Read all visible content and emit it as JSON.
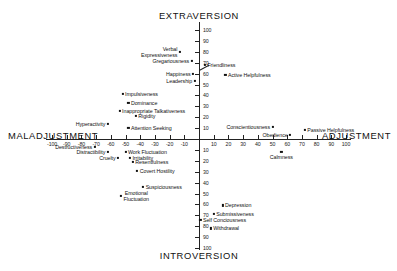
{
  "axes": {
    "top_title": "EXTRAVERSION",
    "bottom_title": "INTROVERSION",
    "left_title": "MALADJUSTMENT",
    "right_title": "ADJUSTMENT"
  },
  "chart_data": {
    "type": "scatter",
    "title": "",
    "xlabel": "MALADJUSTMENT — ADJUSTMENT",
    "ylabel": "INTROVERSION — EXTRAVERSION",
    "xlim": [
      -100,
      100
    ],
    "ylim": [
      -100,
      100
    ],
    "grid": false,
    "legend": "none",
    "xticks": [
      -100,
      -90,
      -80,
      -70,
      -60,
      -50,
      -40,
      -30,
      -20,
      -10,
      10,
      20,
      30,
      40,
      50,
      60,
      70,
      80,
      90,
      100
    ],
    "xtick_labels": [
      "-100",
      "-90",
      "-80",
      "-70",
      "-60",
      "-50",
      "-40",
      "-30",
      "-20",
      "-10",
      "10",
      "20",
      "30",
      "40",
      "50",
      "60",
      "70",
      "80",
      "90",
      "100"
    ],
    "yticks": [
      100,
      90,
      80,
      70,
      60,
      50,
      40,
      30,
      20,
      10,
      -10,
      -20,
      -30,
      -40,
      -50,
      -60,
      -70,
      -80,
      -90,
      -100
    ],
    "ytick_labels": [
      "100",
      "90",
      "80",
      "70",
      "60",
      "50",
      "40",
      "30",
      "20",
      "10",
      "10",
      "20",
      "30",
      "40",
      "50",
      "60",
      "70",
      "80",
      "90",
      "100"
    ],
    "points": [
      {
        "label": "Verbal Expressiveness",
        "x": -13,
        "y": 80,
        "anchor": "right",
        "multiline": true
      },
      {
        "label": "Gregariousness",
        "x": -5,
        "y": 72,
        "anchor": "right"
      },
      {
        "label": "Friendliness",
        "x": 4,
        "y": 68,
        "anchor": "left",
        "leader": true
      },
      {
        "label": "Happiness",
        "x": -4,
        "y": 60,
        "anchor": "right"
      },
      {
        "label": "Active Helpfulness",
        "x": 18,
        "y": 59,
        "anchor": "left"
      },
      {
        "label": "Leadership",
        "x": -3,
        "y": 53,
        "anchor": "right"
      },
      {
        "label": "Impulsiveness",
        "x": -52,
        "y": 41,
        "anchor": "left"
      },
      {
        "label": "Dominance",
        "x": -48,
        "y": 33,
        "anchor": "left"
      },
      {
        "label": "Inappropriate Talkativeness",
        "x": -54,
        "y": 26,
        "anchor": "left"
      },
      {
        "label": "Rigidity",
        "x": -43,
        "y": 21,
        "anchor": "left"
      },
      {
        "label": "Hyperactivity",
        "x": -62,
        "y": 14,
        "anchor": "right"
      },
      {
        "label": "Attention Seeking",
        "x": -48,
        "y": 10,
        "anchor": "left"
      },
      {
        "label": "Conscientiousness",
        "x": 50,
        "y": 11,
        "anchor": "right"
      },
      {
        "label": "Passive Helpfulness",
        "x": 72,
        "y": 8,
        "anchor": "left"
      },
      {
        "label": "Obedience",
        "x": 62,
        "y": 4,
        "anchor": "right"
      },
      {
        "label": "Destructiveness",
        "x": -71,
        "y": -7,
        "anchor": "right"
      },
      {
        "label": "Distractibility",
        "x": -62,
        "y": -12,
        "anchor": "right"
      },
      {
        "label": "Work Fluctuation",
        "x": -50,
        "y": -12,
        "anchor": "left"
      },
      {
        "label": "Cruelty",
        "x": -55,
        "y": -17,
        "anchor": "right"
      },
      {
        "label": "Irritability",
        "x": -47,
        "y": -17,
        "anchor": "left"
      },
      {
        "label": "Resentfulness",
        "x": -45,
        "y": -21,
        "anchor": "left"
      },
      {
        "label": "Calmness",
        "x": 56,
        "y": -12,
        "anchor": "center"
      },
      {
        "label": "Covert Hostility",
        "x": -42,
        "y": -29,
        "anchor": "left"
      },
      {
        "label": "Suspiciousness",
        "x": -38,
        "y": -44,
        "anchor": "left"
      },
      {
        "label": "Emotional Fluctuation",
        "x": -53,
        "y": -52,
        "anchor": "left",
        "multiline": true
      },
      {
        "label": "Depression",
        "x": 16,
        "y": -61,
        "anchor": "left"
      },
      {
        "label": "Submissiveness",
        "x": 10,
        "y": -69,
        "anchor": "left"
      },
      {
        "label": "Self Conciousness",
        "x": 1,
        "y": -74,
        "anchor": "left"
      },
      {
        "label": "Withdrawal",
        "x": 8,
        "y": -82,
        "anchor": "left"
      }
    ]
  }
}
